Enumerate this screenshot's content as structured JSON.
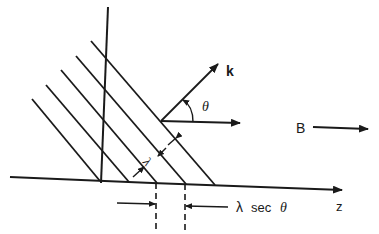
{
  "diagram": {
    "labels": {
      "k": "k",
      "theta": "θ",
      "B": "B",
      "lambda": "λ",
      "lambda_sec_lambda": "λ",
      "lambda_sec_sec": "sec",
      "lambda_sec_theta": "θ",
      "z": "z"
    },
    "colors": {
      "ink": "#1a1a1a",
      "background": "#ffffff"
    }
  }
}
